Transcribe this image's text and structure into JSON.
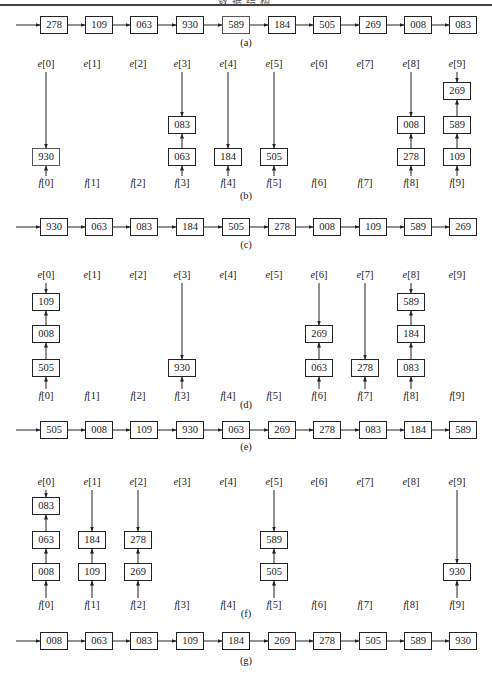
{
  "header": {
    "title": "数据结构"
  },
  "columns": {
    "e_prefix": "e",
    "f_prefix": "f",
    "indices": [
      "0",
      "1",
      "2",
      "3",
      "4",
      "5",
      "6",
      "7",
      "8",
      "9"
    ]
  },
  "diagrams": {
    "a": {
      "caption": "(a)",
      "chain": [
        "278",
        "109",
        "063",
        "930",
        "589",
        "184",
        "505",
        "269",
        "008",
        "083"
      ]
    },
    "b": {
      "caption": "(b)",
      "buckets": [
        [
          "930"
        ],
        [],
        [],
        [
          "063",
          "083"
        ],
        [
          "184"
        ],
        [
          "505"
        ],
        [],
        [],
        [
          "278",
          "008"
        ],
        [
          "109",
          "589",
          "269"
        ]
      ]
    },
    "c": {
      "caption": "(c)",
      "chain": [
        "930",
        "063",
        "083",
        "184",
        "505",
        "278",
        "008",
        "109",
        "589",
        "269"
      ]
    },
    "d": {
      "caption": "(d)",
      "buckets": [
        [
          "505",
          "008",
          "109"
        ],
        [],
        [],
        [
          "930"
        ],
        [],
        [],
        [
          "063",
          "269"
        ],
        [
          "278"
        ],
        [
          "083",
          "184",
          "589"
        ],
        []
      ]
    },
    "e": {
      "caption": "(e)",
      "chain": [
        "505",
        "008",
        "109",
        "930",
        "063",
        "269",
        "278",
        "083",
        "184",
        "589"
      ]
    },
    "f": {
      "caption": "(f)",
      "buckets": [
        [
          "008",
          "063",
          "083"
        ],
        [
          "109",
          "184"
        ],
        [
          "269",
          "278"
        ],
        [],
        [],
        [
          "505",
          "589"
        ],
        [],
        [],
        [],
        [
          "930"
        ]
      ]
    },
    "g": {
      "caption": "(g)",
      "chain": [
        "008",
        "063",
        "083",
        "109",
        "184",
        "269",
        "278",
        "505",
        "589",
        "930"
      ]
    }
  }
}
